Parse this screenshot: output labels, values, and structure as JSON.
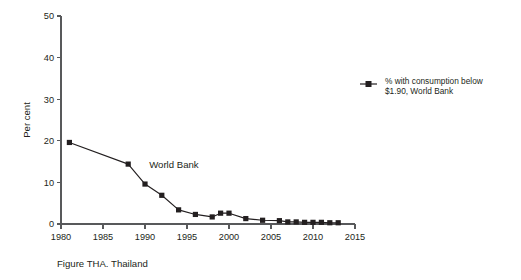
{
  "figure": {
    "caption": "Figure THA. Thailand",
    "annotation_label": "World Bank"
  },
  "legend": {
    "position": "right",
    "marker": "filled-square",
    "line1": "% with consumption below",
    "line2": "$1.90, World Bank"
  },
  "axes": {
    "y_title": "Per cent",
    "y_ticks": [
      "0",
      "10",
      "20",
      "30",
      "40",
      "50"
    ],
    "x_ticks": [
      "1980",
      "1985",
      "1990",
      "1995",
      "2000",
      "2005",
      "2010",
      "2015"
    ]
  },
  "chart_data": {
    "type": "line",
    "title": "Figure THA. Thailand",
    "xlabel": "",
    "ylabel": "Per cent",
    "xlim": [
      1980,
      2016
    ],
    "ylim": [
      0,
      50
    ],
    "grid": false,
    "legend_position": "right",
    "annotations": [
      {
        "text": "World Bank",
        "x": 1990.5,
        "y": 13.5
      }
    ],
    "series": [
      {
        "name": "% with consumption below $1.90, World Bank",
        "color": "#231f20",
        "marker": "square",
        "x": [
          1981,
          1988,
          1990,
          1992,
          1994,
          1996,
          1998,
          1999,
          2000,
          2002,
          2004,
          2006,
          2007,
          2008,
          2009,
          2010,
          2011,
          2012,
          2013
        ],
        "values": [
          19.6,
          14.4,
          9.6,
          6.9,
          3.4,
          2.3,
          1.7,
          2.6,
          2.6,
          1.3,
          0.9,
          0.8,
          0.5,
          0.5,
          0.4,
          0.4,
          0.4,
          0.3,
          0.3
        ]
      }
    ]
  }
}
